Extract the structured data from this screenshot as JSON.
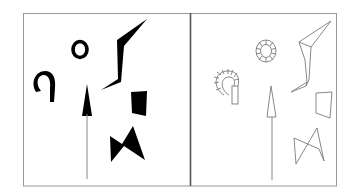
{
  "figure": {
    "description": "Two-panel figure: left panel shows solid black silhouette shapes; right panel shows the same shapes as thin outline drawings",
    "panels": [
      {
        "id": "left",
        "label": "Filled silhouettes",
        "style": "filled-black",
        "shapes": [
          "hook-shape",
          "ring",
          "lightning-bolt-polygon",
          "arrow",
          "quadrilateral",
          "bowtie"
        ]
      },
      {
        "id": "right",
        "label": "Outline drawings",
        "style": "outlined",
        "shapes": [
          "segmented-hook-shape",
          "segmented-ring",
          "lightning-bolt-outline",
          "arrow-outline",
          "quadrilateral-outline",
          "bowtie-outline"
        ]
      }
    ],
    "colors": {
      "background": "#ffffff",
      "frame": "#9a9a9a",
      "divider": "#555555",
      "fill": "#000000",
      "outline": "#7a7a7a"
    }
  }
}
